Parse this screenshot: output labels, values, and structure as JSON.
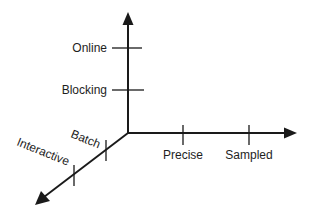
{
  "diagram": {
    "type": "three-axis-design-space",
    "colors": {
      "ink": "#1a1a1a",
      "background": "#ffffff"
    },
    "axes": [
      {
        "id": "vertical",
        "direction": "up",
        "ticks": [
          {
            "label": "Blocking"
          },
          {
            "label": "Online"
          }
        ]
      },
      {
        "id": "horizontal",
        "direction": "right",
        "ticks": [
          {
            "label": "Precise"
          },
          {
            "label": "Sampled"
          }
        ]
      },
      {
        "id": "diagonal",
        "direction": "down-left",
        "ticks": [
          {
            "label": "Batch"
          },
          {
            "label": "Interactive"
          }
        ]
      }
    ]
  }
}
